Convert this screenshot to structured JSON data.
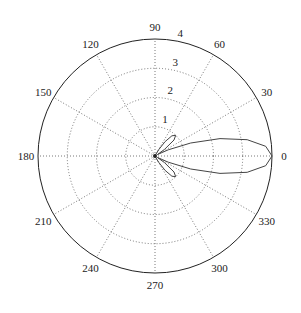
{
  "chart_data": {
    "type": "polar",
    "title": "",
    "r_ticks": [
      1,
      2,
      3,
      4
    ],
    "r_max": 4,
    "theta_ticks": [
      0,
      30,
      60,
      90,
      120,
      150,
      180,
      210,
      240,
      270,
      300,
      330
    ],
    "theta_labels": [
      "0",
      "30",
      "60",
      "90",
      "120",
      "150",
      "180",
      "210",
      "240",
      "270",
      "300",
      "330"
    ],
    "r_tick_labels": [
      "1",
      "2",
      "3",
      "4"
    ],
    "grid": true,
    "legend": null,
    "series": [
      {
        "name": "radiation pattern",
        "description": "Main lobe along 0° reaching r≈4, side lobes near ±45° reaching r≈1",
        "theta_deg": [
          0,
          5,
          10,
          15,
          20,
          25,
          30,
          35,
          40,
          45,
          50,
          55,
          60,
          65,
          70,
          80,
          90,
          180,
          270,
          280,
          290,
          295,
          300,
          305,
          310,
          315,
          320,
          325,
          330,
          335,
          340,
          345,
          350,
          355,
          360
        ],
        "r": [
          4.0,
          3.8,
          3.2,
          2.3,
          1.3,
          0.5,
          0.1,
          0.4,
          0.85,
          1.0,
          0.9,
          0.6,
          0.25,
          0.05,
          0.0,
          0.0,
          0.0,
          0.0,
          0.0,
          0.0,
          0.0,
          0.05,
          0.25,
          0.6,
          0.9,
          1.0,
          0.85,
          0.4,
          0.1,
          0.5,
          1.3,
          2.3,
          3.2,
          3.8,
          4.0
        ]
      }
    ]
  }
}
